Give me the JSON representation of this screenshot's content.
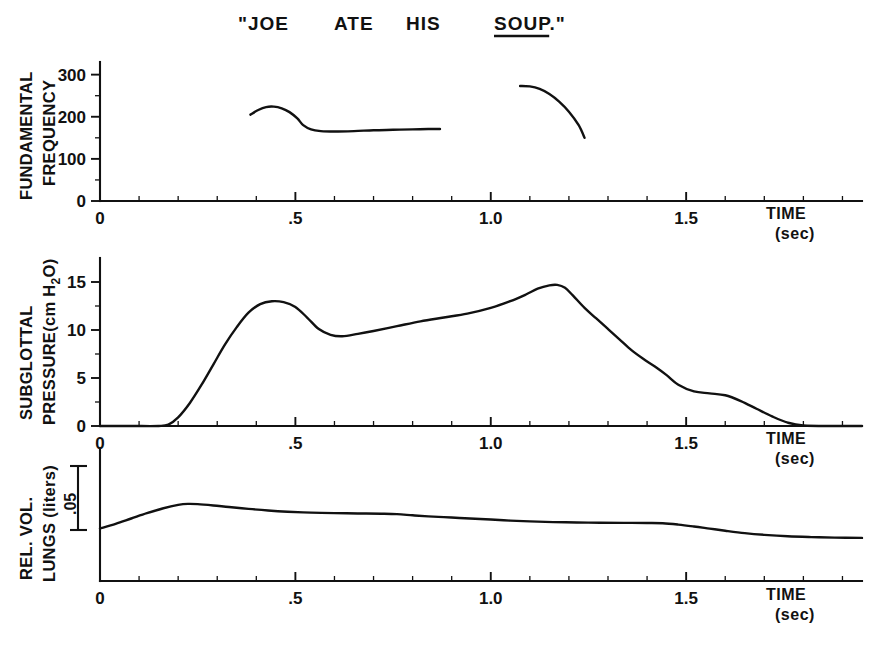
{
  "figure": {
    "utterance_parts": [
      {
        "text": "\"JOE",
        "x": 238,
        "underline": false
      },
      {
        "text": "ATE",
        "x": 334,
        "underline": false
      },
      {
        "text": "HIS",
        "x": 406,
        "underline": false
      },
      {
        "text": "SOUP.\"",
        "x": 494,
        "underline": true
      }
    ],
    "utterance_full": "\"JOE ATE HIS SOUP.\"",
    "underlined_word": "SOUP"
  },
  "axis_common": {
    "time_label_line1": "TIME",
    "time_label_line2": "(sec)",
    "x_major_ticks": [
      0,
      0.5,
      1.0,
      1.5
    ],
    "x_major_labels": [
      "0",
      ".5",
      "1.0",
      "1.5"
    ],
    "x_minor_step": 0.1,
    "x_range": [
      0,
      1.95
    ]
  },
  "chart_data": [
    {
      "type": "line",
      "panel": "fundamental-frequency",
      "title": "",
      "ylabel": "FUNDAMENTAL FREQUENCY",
      "ylabel_line1": "FUNDAMENTAL",
      "ylabel_line2": "FREQUENCY",
      "xlabel": "TIME (sec)",
      "yunit": "Hz",
      "ylim": [
        0,
        330
      ],
      "xlim": [
        0,
        1.95
      ],
      "y_ticks": [
        0,
        100,
        200,
        300
      ],
      "y_tick_labels": [
        "0",
        "100",
        "200",
        "300"
      ],
      "y_minor_ticks": [
        50,
        150,
        250
      ],
      "grid": false,
      "legend": false,
      "series": [
        {
          "name": "f0-segment-1",
          "x": [
            0.385,
            0.405,
            0.425,
            0.445,
            0.465,
            0.485,
            0.505,
            0.52,
            0.54,
            0.565,
            0.6,
            0.65,
            0.7,
            0.75,
            0.8,
            0.84,
            0.87
          ],
          "y": [
            205,
            216,
            223,
            224,
            220,
            211,
            196,
            180,
            170,
            166,
            165,
            166,
            168,
            169,
            170,
            171,
            171
          ]
        },
        {
          "name": "f0-segment-2",
          "x": [
            1.075,
            1.1,
            1.125,
            1.15,
            1.175,
            1.2,
            1.225,
            1.24
          ],
          "y": [
            273,
            272,
            266,
            254,
            236,
            212,
            180,
            150
          ]
        }
      ]
    },
    {
      "type": "line",
      "panel": "subglottal-pressure",
      "title": "",
      "ylabel": "SUBGLOTTAL PRESSURE(cm H2O)",
      "ylabel_line1": "SUBGLOTTAL",
      "ylabel_line2": "PRESSURE(cm H",
      "ylabel_sub": "2",
      "ylabel_line2b": "O)",
      "xlabel": "TIME (sec)",
      "yunit": "cm H2O",
      "ylim": [
        0,
        17.5
      ],
      "xlim": [
        0,
        1.95
      ],
      "y_ticks": [
        0,
        5,
        10,
        15
      ],
      "y_tick_labels": [
        "0",
        "5",
        "10",
        "15"
      ],
      "y_minor_ticks": [
        2.5,
        7.5,
        12.5
      ],
      "grid": false,
      "legend": false,
      "series": [
        {
          "name": "subglottal-pressure-trace",
          "x": [
            0.0,
            0.08,
            0.15,
            0.175,
            0.2,
            0.23,
            0.26,
            0.29,
            0.32,
            0.35,
            0.38,
            0.41,
            0.44,
            0.47,
            0.5,
            0.53,
            0.56,
            0.59,
            0.62,
            0.66,
            0.7,
            0.76,
            0.82,
            0.88,
            0.94,
            1.0,
            1.05,
            1.09,
            1.12,
            1.15,
            1.17,
            1.19,
            1.21,
            1.24,
            1.27,
            1.3,
            1.33,
            1.36,
            1.39,
            1.42,
            1.45,
            1.48,
            1.52,
            1.56,
            1.6,
            1.64,
            1.68,
            1.72,
            1.76,
            1.8,
            1.88,
            1.95
          ],
          "y": [
            0.0,
            0.0,
            0.0,
            0.15,
            0.9,
            2.4,
            4.3,
            6.4,
            8.5,
            10.3,
            11.8,
            12.7,
            13.0,
            12.9,
            12.4,
            11.3,
            10.1,
            9.5,
            9.35,
            9.6,
            9.9,
            10.4,
            10.9,
            11.3,
            11.7,
            12.3,
            13.0,
            13.7,
            14.3,
            14.65,
            14.7,
            14.4,
            13.6,
            12.3,
            11.2,
            10.1,
            9.0,
            7.9,
            7.0,
            6.2,
            5.3,
            4.3,
            3.6,
            3.4,
            3.2,
            2.6,
            1.8,
            1.0,
            0.35,
            0.05,
            0.0,
            0.0
          ]
        }
      ]
    },
    {
      "type": "line",
      "panel": "relative-lung-volume",
      "title": "",
      "ylabel": "REL. VOL. LUNGS (liters)",
      "ylabel_line1": "REL. VOL.",
      "ylabel_line2": "LUNGS (liters)",
      "xlabel": "TIME (sec)",
      "yunit": "liters",
      "calibration_bar": ".05",
      "calibration_value": 0.05,
      "ylim": [
        0,
        1.0
      ],
      "xlim": [
        0,
        1.95
      ],
      "y_ticks": [],
      "y_tick_labels": [],
      "grid": false,
      "legend": false,
      "series": [
        {
          "name": "lung-volume-trace",
          "x": [
            0.0,
            0.04,
            0.08,
            0.12,
            0.16,
            0.2,
            0.225,
            0.25,
            0.29,
            0.33,
            0.38,
            0.43,
            0.48,
            0.54,
            0.6,
            0.66,
            0.72,
            0.76,
            0.8,
            0.84,
            0.88,
            0.92,
            0.96,
            1.0,
            1.05,
            1.1,
            1.16,
            1.22,
            1.28,
            1.34,
            1.4,
            1.44,
            1.48,
            1.52,
            1.56,
            1.6,
            1.65,
            1.7,
            1.76,
            1.82,
            1.88,
            1.95
          ],
          "y": [
            0.395,
            0.43,
            0.47,
            0.51,
            0.545,
            0.572,
            0.58,
            0.578,
            0.568,
            0.556,
            0.542,
            0.53,
            0.521,
            0.514,
            0.51,
            0.508,
            0.506,
            0.503,
            0.494,
            0.486,
            0.48,
            0.474,
            0.468,
            0.462,
            0.454,
            0.448,
            0.443,
            0.44,
            0.438,
            0.437,
            0.436,
            0.434,
            0.424,
            0.41,
            0.394,
            0.378,
            0.36,
            0.347,
            0.336,
            0.33,
            0.326,
            0.324
          ]
        }
      ]
    }
  ]
}
